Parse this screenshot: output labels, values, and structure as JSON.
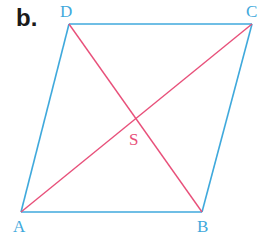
{
  "figure": {
    "part_label": "b.",
    "shape": "parallelogram",
    "colors": {
      "sides": "#3fa9dc",
      "diagonals": "#e8507a",
      "vertex_labels": "#3fa9dc",
      "center_label": "#e8507a"
    },
    "vertices": {
      "A": {
        "label": "A",
        "x": 21,
        "y": 212
      },
      "B": {
        "label": "B",
        "x": 202,
        "y": 212
      },
      "C": {
        "label": "C",
        "x": 252,
        "y": 24
      },
      "D": {
        "label": "D",
        "x": 69,
        "y": 24
      }
    },
    "center": {
      "label": "S",
      "x": 136,
      "y": 118
    },
    "sides": [
      "AB",
      "BC",
      "CD",
      "DA"
    ],
    "diagonals": [
      "AC",
      "BD"
    ]
  }
}
